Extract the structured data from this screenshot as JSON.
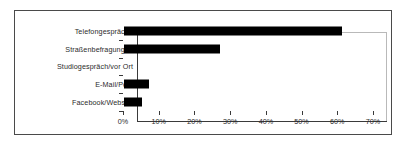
{
  "chart_data": {
    "type": "bar",
    "orientation": "horizontal",
    "title": "",
    "xlabel": "",
    "ylabel": "",
    "categories": [
      "Telefongespräche",
      "Straßenbefragungen",
      "Studiogespräch/vor Ort",
      "E-Mail/Post",
      "Facebook/Website"
    ],
    "values": [
      61,
      27,
      0,
      7,
      5
    ],
    "xlim": [
      0,
      70
    ],
    "xticks": [
      0,
      10,
      20,
      30,
      40,
      50,
      60,
      70
    ],
    "xtick_labels": [
      "0%",
      "10%",
      "20%",
      "30%",
      "40%",
      "50%",
      "60%",
      "70%"
    ],
    "grid": false,
    "legend": null,
    "bar_color": "#000000",
    "plot_border_color": "#b9b9b9",
    "axis_color": "#3a3a3a",
    "frame_color": "#4a4a4a",
    "background_color": "#ffffff"
  }
}
